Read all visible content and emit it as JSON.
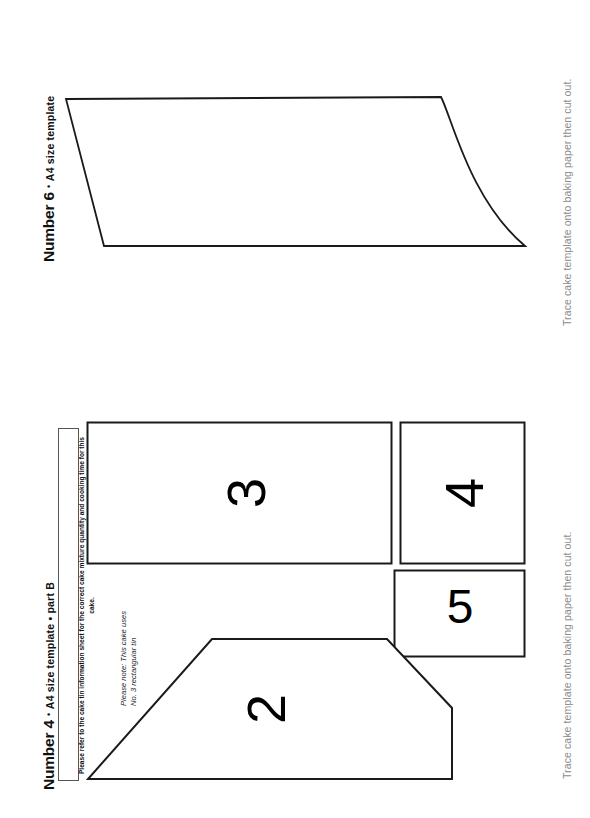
{
  "document": {
    "background_color": "#ffffff",
    "line_color": "#1a1a1a",
    "note_color": "#8c8c8c"
  },
  "sections": [
    {
      "id": "number-6",
      "title_main": "Number 6",
      "title_sep": "•",
      "title_sub": "A4 size template",
      "trace_note": "Trace cake template onto baking paper then cut out.",
      "shapes": [
        {
          "name": "curved-slab-piece",
          "label": "",
          "type": "path"
        }
      ]
    },
    {
      "id": "number-4-part-b",
      "title_main": "Number 4",
      "title_sep": "•",
      "title_sub": "A4 size template • part B",
      "trace_note": "Trace cake template onto baking paper then cut out.",
      "info_box_text": "Please refer to the cake tin information sheet for the correct cake mixture quantity and cooking time for this cake.",
      "please_note_line1": "Please note: This cake uses",
      "please_note_line2": "No. 3 rectangular tin",
      "shapes": [
        {
          "name": "piece-3",
          "label": "3",
          "type": "rectangle"
        },
        {
          "name": "piece-4",
          "label": "4",
          "type": "rectangle"
        },
        {
          "name": "piece-5",
          "label": "5",
          "type": "rectangle"
        },
        {
          "name": "piece-2",
          "label": "2",
          "type": "trapezoid"
        }
      ]
    }
  ]
}
